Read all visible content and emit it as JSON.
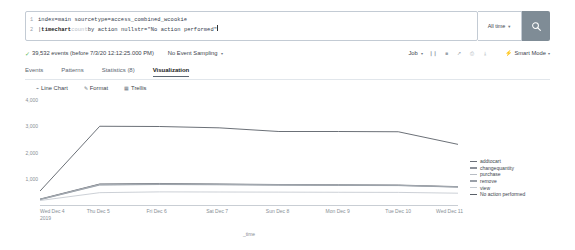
{
  "search": {
    "lines": [
      {
        "num": "1",
        "text": "index=main sourcetype=access_combined_wcookie"
      },
      {
        "num": "2",
        "pipe": "| ",
        "cmd": "timechart ",
        "fn": "count ",
        "rest": "by action nullstr=\"No action performed\""
      }
    ],
    "time_range": "All time",
    "search_icon": "search-icon"
  },
  "jobbar": {
    "event_count": "39,532 events (before 7/3/20 12:12:25.000 PM)",
    "sampling": "No Event Sampling",
    "job_label": "Job",
    "icons": [
      "pause-icon",
      "stop-icon",
      "share-icon",
      "print-icon",
      "export-icon"
    ],
    "mode": "Smart Mode"
  },
  "tabs": [
    {
      "label": "Events",
      "active": false
    },
    {
      "label": "Patterns",
      "active": false
    },
    {
      "label": "Statistics (8)",
      "active": false
    },
    {
      "label": "Visualization",
      "active": true
    }
  ],
  "viztools": [
    {
      "icon": "line-chart-icon",
      "label": "Line Chart"
    },
    {
      "icon": "pencil-icon",
      "label": "Format"
    },
    {
      "icon": "grid-icon",
      "label": "Trellis"
    }
  ],
  "chart_data": {
    "type": "line",
    "title": "",
    "xlabel": "_time",
    "ylabel": "",
    "ylim": [
      0,
      4000
    ],
    "yticks": [
      1000,
      2000,
      3000,
      4000
    ],
    "ytick_labels": [
      "1,000",
      "2,000",
      "3,000",
      "4,000"
    ],
    "grid": false,
    "legend_position": "right",
    "categories": [
      "Wed Dec 4 2019",
      "Thu Dec 5",
      "Fri Dec 6",
      "Sat Dec 7",
      "Sun Dec 8",
      "Mon Dec 9",
      "Tue Dec 10",
      "Wed Dec 11"
    ],
    "x_tick_lines": [
      [
        "Wed Dec 4",
        "2019"
      ],
      [
        "Thu Dec 5"
      ],
      [
        "Fri Dec 6"
      ],
      [
        "Sat Dec 7"
      ],
      [
        "Sun Dec 8"
      ],
      [
        "Mon Dec 9"
      ],
      [
        "Tue Dec 10"
      ],
      [
        "Wed Dec 11"
      ]
    ],
    "series": [
      {
        "name": "addtocart",
        "color": "#6b7078",
        "values": [
          225,
          800,
          820,
          800,
          780,
          770,
          760,
          700
        ]
      },
      {
        "name": "changequantity",
        "color": "#8c9199",
        "values": [
          215,
          790,
          800,
          790,
          770,
          760,
          750,
          690
        ]
      },
      {
        "name": "purchase",
        "color": "#b8bdc4",
        "values": [
          205,
          770,
          790,
          780,
          760,
          750,
          745,
          685
        ]
      },
      {
        "name": "remove",
        "color": "#9aa0a8",
        "values": [
          200,
          760,
          780,
          770,
          755,
          745,
          740,
          680
        ]
      },
      {
        "name": "view",
        "color": "#c6cbd1",
        "values": [
          170,
          470,
          500,
          495,
          490,
          485,
          480,
          450
        ]
      },
      {
        "name": "No action performed",
        "color": "#5a6068",
        "values": [
          530,
          3000,
          2990,
          2940,
          2800,
          2800,
          2790,
          2310
        ]
      }
    ]
  }
}
